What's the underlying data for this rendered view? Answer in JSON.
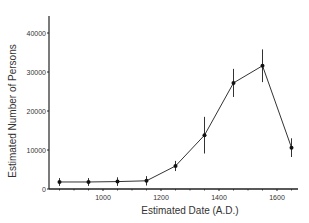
{
  "chart_data": {
    "type": "line",
    "title": "",
    "xlabel": "Estimated Date (A.D.)",
    "ylabel": "Estimated Number of Persons",
    "xlim": [
      800,
      1680
    ],
    "ylim": [
      0,
      45000
    ],
    "x_ticks": [
      1000,
      1200,
      1400,
      1600
    ],
    "y_ticks": [
      0,
      10000,
      20000,
      30000,
      40000
    ],
    "grid": false,
    "legend": null,
    "series": [
      {
        "name": "Estimated population",
        "x": [
          850,
          950,
          1050,
          1150,
          1250,
          1350,
          1450,
          1550,
          1650
        ],
        "values": [
          1800,
          1800,
          1900,
          2100,
          5900,
          13800,
          27200,
          31600,
          10600
        ],
        "error": [
          1000,
          1000,
          1100,
          1200,
          1300,
          4700,
          3600,
          4200,
          2400
        ]
      }
    ]
  }
}
